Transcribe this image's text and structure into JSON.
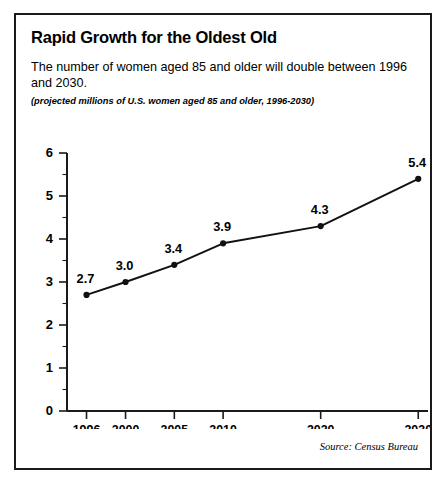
{
  "figure": {
    "title": "Rapid Growth for the Oldest Old",
    "subtitle": "The number of women aged 85 and older will double between 1996 and 2030.",
    "note": "(projected millions of U.S. women aged 85 and older, 1996-2030)",
    "source": "Source: Census Bureau",
    "border_color": "#1a1a1a",
    "background_color": "#ffffff"
  },
  "chart_data": {
    "type": "line",
    "title": "Rapid Growth for the Oldest Old",
    "subtitle": "The number of women aged 85 and older will double between 1996 and 2030.",
    "annotation": "(projected millions of U.S. women aged 85 and older, 1996-2030)",
    "source": "Source: Census Bureau",
    "xlabel": "",
    "ylabel": "",
    "categories": [
      "1996",
      "2000",
      "2005",
      "2010",
      "2020",
      "2030"
    ],
    "x": [
      1996,
      2000,
      2005,
      2010,
      2020,
      2030
    ],
    "values": [
      2.7,
      3.0,
      3.4,
      3.9,
      4.3,
      5.4
    ],
    "point_labels": [
      "2.7",
      "3.0",
      "3.4",
      "3.9",
      "4.3",
      "5.4"
    ],
    "ylim": [
      0,
      6
    ],
    "xlim": [
      1994,
      2031
    ],
    "ytick_labels": [
      "0",
      "1",
      "2",
      "3",
      "4",
      "5",
      "6"
    ],
    "yticks": [
      0,
      1,
      2,
      3,
      4,
      5,
      6
    ],
    "yminor_ticks": [
      0.5,
      1.5,
      2.5,
      3.5,
      4.5,
      5.5
    ],
    "xtick_labels": [
      "1996",
      "2000",
      "2005",
      "2010",
      "2020",
      "2030"
    ],
    "grid": false,
    "legend": false,
    "line_color": "#111111",
    "marker_color": "#111111",
    "axis_color": "#1a1a1a"
  }
}
